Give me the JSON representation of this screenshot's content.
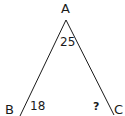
{
  "figure": {
    "type": "triangle-angle-problem",
    "stroke_color": "#1a1a1a",
    "vertices": {
      "A": {
        "label": "A",
        "position": "top"
      },
      "B": {
        "label": "B",
        "position": "bottom-left"
      },
      "C": {
        "label": "C",
        "position": "bottom-right"
      }
    },
    "angles": {
      "A": "25",
      "B": "18",
      "C": "?"
    },
    "sides_drawn": [
      "AB",
      "AC"
    ]
  }
}
